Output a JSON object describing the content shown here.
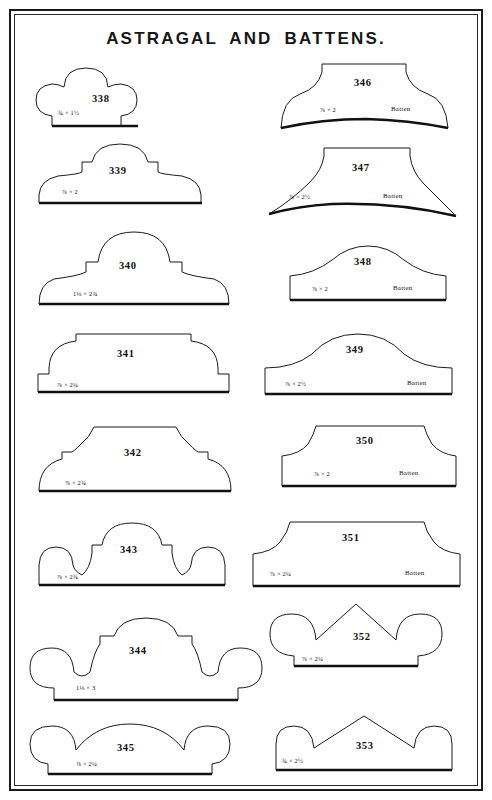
{
  "plate": {
    "title": "ASTRAGAL AND BATTENS.",
    "border_color": "#1a1a1a",
    "ink_color": "#1b1b1b",
    "paper_color": "#ffffff"
  },
  "figures": [
    {
      "number": "338",
      "dimension": "¾ × 1½",
      "batten": "",
      "column": "left",
      "shape": "triple-bead"
    },
    {
      "number": "339",
      "dimension": "⅞ × 2",
      "batten": "",
      "column": "left",
      "shape": "dome-step"
    },
    {
      "number": "340",
      "dimension": "1⅛ × 2¾",
      "batten": "",
      "column": "left",
      "shape": "dome-ogee"
    },
    {
      "number": "341",
      "dimension": "⅞ × 2¼",
      "batten": "",
      "column": "left",
      "shape": "flat-top-round"
    },
    {
      "number": "342",
      "dimension": "⅞ × 2¾",
      "batten": "",
      "column": "left",
      "shape": "flat-cove"
    },
    {
      "number": "343",
      "dimension": "⅞ × 2¾",
      "batten": "",
      "column": "left",
      "shape": "triple-arch"
    },
    {
      "number": "344",
      "dimension": "1⅛ × 3",
      "batten": "",
      "column": "left",
      "shape": "wide-triple-bead"
    },
    {
      "number": "345",
      "dimension": "⅞ × 2¼",
      "batten": "",
      "column": "left",
      "shape": "double-bead"
    },
    {
      "number": "346",
      "dimension": "⅞ × 2",
      "batten": "Batten",
      "column": "right",
      "shape": "batten-flare-curved-base"
    },
    {
      "number": "347",
      "dimension": "⅞ × 2½",
      "batten": "Batten",
      "column": "right",
      "shape": "batten-flare-wide"
    },
    {
      "number": "348",
      "dimension": "⅞ × 2",
      "batten": "Batten",
      "column": "right",
      "shape": "batten-ogee-peak"
    },
    {
      "number": "349",
      "dimension": "⅞ × 2½",
      "batten": "Batten",
      "column": "right",
      "shape": "batten-bell"
    },
    {
      "number": "350",
      "dimension": "⅞ × 2",
      "batten": "Batten",
      "column": "right",
      "shape": "batten-flat-shoulder"
    },
    {
      "number": "351",
      "dimension": "⅞ × 2¼",
      "batten": "Batten",
      "column": "right",
      "shape": "batten-wide-shoulder"
    },
    {
      "number": "352",
      "dimension": "⅞ × 2¼",
      "batten": "",
      "column": "right",
      "shape": "gothic-double-bead"
    },
    {
      "number": "353",
      "dimension": "¾ × 2½",
      "batten": "",
      "column": "right",
      "shape": "gothic-peak-bead"
    }
  ]
}
